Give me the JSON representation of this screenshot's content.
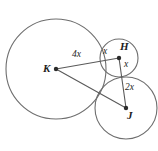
{
  "figure": {
    "type": "geometry-diagram",
    "background_color": "#ffffff",
    "stroke_color": "#6e6e6e",
    "segment_color": "#5a5a5a",
    "dot_color": "#2b2b2b"
  },
  "points": [
    {
      "id": "K",
      "label": "K",
      "cx": 56,
      "cy": 69,
      "label_x": 43,
      "label_y": 63
    },
    {
      "id": "H",
      "label": "H",
      "cx": 119,
      "cy": 58,
      "label_x": 120,
      "label_y": 41
    },
    {
      "id": "J",
      "label": "J",
      "cx": 126,
      "cy": 108,
      "label_x": 127,
      "label_y": 110
    }
  ],
  "circles": [
    {
      "id": "circle-K",
      "center": "K",
      "cx": 56,
      "cy": 69,
      "r": 50
    },
    {
      "id": "circle-H",
      "center": "H",
      "cx": 119,
      "cy": 58,
      "r": 19
    },
    {
      "id": "circle-J",
      "center": "J",
      "cx": 126,
      "cy": 108,
      "r": 31
    }
  ],
  "segments": [
    {
      "id": "segment-KH",
      "from": "K",
      "to": "H",
      "x1": 56,
      "y1": 69,
      "x2": 119,
      "y2": 58
    },
    {
      "id": "segment-HJ",
      "from": "H",
      "to": "J",
      "x1": 119,
      "y1": 58,
      "x2": 126,
      "y2": 108
    },
    {
      "id": "segment-KJ",
      "from": "K",
      "to": "J",
      "x1": 56,
      "y1": 69,
      "x2": 126,
      "y2": 108
    }
  ],
  "length_labels": [
    {
      "id": "label-4x",
      "text": "4x",
      "x": 72,
      "y": 50,
      "segment": "segment-KH"
    },
    {
      "id": "label-x-upper",
      "text": "x",
      "x": 103,
      "y": 47,
      "segment": "segment-KH"
    },
    {
      "id": "label-x-lower",
      "text": "x",
      "x": 124,
      "y": 60,
      "segment": "segment-HJ"
    },
    {
      "id": "label-2x",
      "text": "2x",
      "x": 125,
      "y": 83,
      "segment": "segment-HJ"
    }
  ]
}
